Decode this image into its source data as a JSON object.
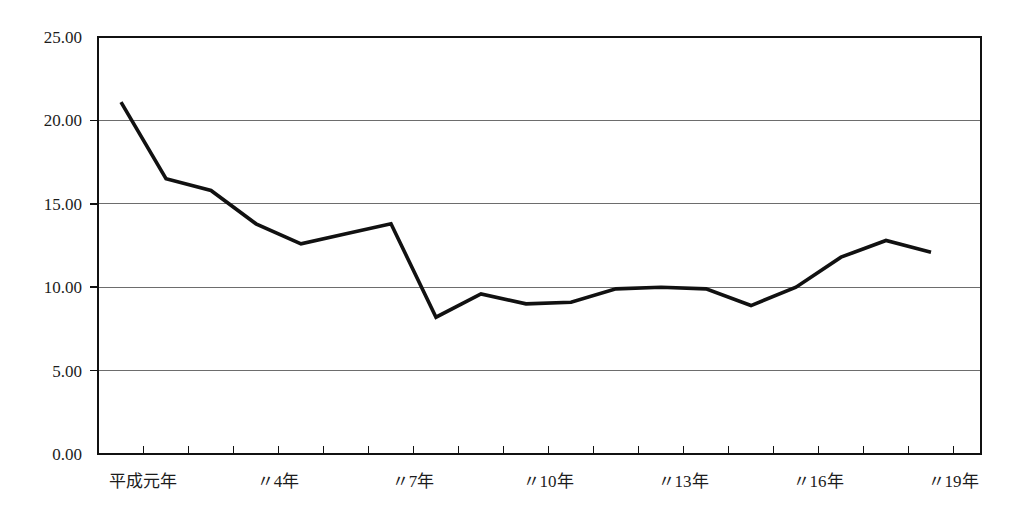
{
  "chart_data": {
    "type": "line",
    "title": "",
    "xlabel": "",
    "ylabel": "",
    "ylim": [
      0,
      25
    ],
    "ytick_interval": 5,
    "yticks": [
      "0.00",
      "5.00",
      "10.00",
      "15.00",
      "20.00",
      "25.00"
    ],
    "grid": true,
    "legend": false,
    "legend_position": "none",
    "line_color": "#111111",
    "grid_color": "#6d6d6d",
    "frame_color": "#111111",
    "background_color": "#ffffff",
    "x": [
      "平成元年",
      "〃2年",
      "〃3年",
      "〃4年",
      "〃5年",
      "〃6年",
      "〃7年",
      "〃8年",
      "〃9年",
      "〃10年",
      "〃11年",
      "〃12年",
      "〃13年",
      "〃14年",
      "〃15年",
      "〃16年",
      "〃17年",
      "〃18年",
      "〃19年"
    ],
    "xtick_labels": [
      "平成元年",
      "〃4年",
      "〃7年",
      "〃10年",
      "〃13年",
      "〃16年",
      "〃19年"
    ],
    "values": [
      21.1,
      16.5,
      15.8,
      13.8,
      12.6,
      13.2,
      13.8,
      8.2,
      9.6,
      9.0,
      9.1,
      9.9,
      10.0,
      9.9,
      8.9,
      10.0,
      11.8,
      12.8,
      12.1
    ],
    "series": [
      {
        "name": "series-1",
        "values": [
          21.1,
          16.5,
          15.8,
          13.8,
          12.6,
          13.2,
          13.8,
          8.2,
          9.6,
          9.0,
          9.1,
          9.9,
          10.0,
          9.9,
          8.9,
          10.0,
          11.8,
          12.8,
          12.1
        ]
      }
    ]
  },
  "axis": {
    "y_labels": [
      "25.00",
      "20.00",
      "15.00",
      "10.00",
      "5.00",
      "0.00"
    ],
    "x_labels": [
      "平成元年",
      "〃4年",
      "〃7年",
      "〃10年",
      "〃13年",
      "〃16年",
      "〃19年"
    ]
  },
  "header": {
    "title": ""
  }
}
